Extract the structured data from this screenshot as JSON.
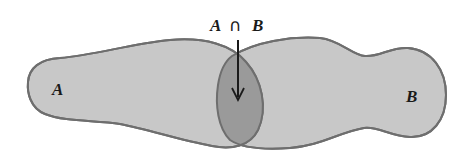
{
  "diagram": {
    "type": "venn",
    "title_label": {
      "left": "A",
      "operator": "∩",
      "right": "B"
    },
    "sets": [
      {
        "id": "A",
        "label": "A"
      },
      {
        "id": "B",
        "label": "B"
      }
    ],
    "intersection": {
      "label": "A ∩ B",
      "pointer": "arrow-down"
    },
    "colors": {
      "set_fill": "#c8c8c8",
      "intersection_fill": "#9a9a9a",
      "outline": "#6e6e6e",
      "text": "#1a1a1a",
      "background": "#ffffff"
    }
  }
}
